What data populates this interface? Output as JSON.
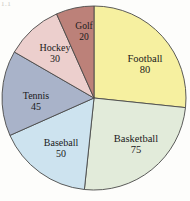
{
  "figure": {
    "number_label": "1.1"
  },
  "chart_data": {
    "type": "pie",
    "title": "",
    "xlabel": "",
    "ylabel": "",
    "total": 300,
    "start_angle_deg": 0,
    "direction": "clockwise",
    "legend": "none",
    "grid": false,
    "categories": [
      "Football",
      "Basketball",
      "Baseball",
      "Tennis",
      "Hockey",
      "Golf"
    ],
    "values": [
      80,
      75,
      50,
      45,
      30,
      20
    ],
    "slices": [
      {
        "label": "Football",
        "value": 80,
        "value_text": "80",
        "color": "#f6f0a0",
        "angle_deg": 96,
        "start_deg": 0,
        "end_deg": 96,
        "label_x": 145,
        "label_y": 64
      },
      {
        "label": "Basketball",
        "value": 75,
        "value_text": "75",
        "color": "#e2ebda",
        "angle_deg": 90,
        "start_deg": 96,
        "end_deg": 186,
        "label_x": 136,
        "label_y": 144
      },
      {
        "label": "Baseball",
        "value": 50,
        "value_text": "50",
        "color": "#cde3ef",
        "angle_deg": 60,
        "start_deg": 186,
        "end_deg": 246,
        "label_x": 61,
        "label_y": 148
      },
      {
        "label": "Tennis",
        "value": 45,
        "value_text": "45",
        "color": "#a9b3c9",
        "angle_deg": 54,
        "start_deg": 246,
        "end_deg": 300,
        "label_x": 36,
        "label_y": 101
      },
      {
        "label": "Hockey",
        "value": 30,
        "value_text": "30",
        "color": "#eccfcd",
        "angle_deg": 36,
        "start_deg": 300,
        "end_deg": 336,
        "label_x": 55,
        "label_y": 53
      },
      {
        "label": "Golf",
        "value": 20,
        "value_text": "20",
        "color": "#bc8179",
        "angle_deg": 24,
        "start_deg": 336,
        "end_deg": 360,
        "label_x": 84,
        "label_y": 32
      }
    ],
    "geometry": {
      "center_x": 94,
      "center_y": 98,
      "radius": 92,
      "stroke_color": "#4a4a48",
      "stroke_width": 0.9
    },
    "background_color": "#fdfdfb"
  }
}
